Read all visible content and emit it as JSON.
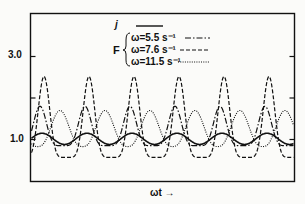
{
  "chart_data": {
    "type": "line",
    "title": "",
    "xlabel": "ωt →",
    "ylabel": "",
    "ylim": [
      0.0,
      4.0
    ],
    "y_ticks": [
      {
        "value": 1.0,
        "label": "1.0"
      },
      {
        "value": 2.0,
        "label": ""
      },
      {
        "value": 3.0,
        "label": "3.0"
      }
    ],
    "x_ticks": [],
    "grid": false,
    "legend_position": "top-center",
    "legend": {
      "group_label": "F",
      "entries": [
        {
          "name": "j",
          "style": "solid"
        },
        {
          "name": "ω=5.5 s⁻¹",
          "style": "dash-dot",
          "group": "F"
        },
        {
          "name": "ω=7.6 s⁻¹",
          "style": "dashed",
          "group": "F"
        },
        {
          "name": "ω=11.5 s⁻¹",
          "style": "dotted",
          "group": "F"
        }
      ]
    },
    "period_px": 45,
    "cycles_shown": 6,
    "series": [
      {
        "name": "j",
        "style": "solid",
        "min": 0.88,
        "max": 1.15,
        "peak_phase_x": [
          42,
          87,
          132,
          177,
          222,
          267
        ]
      },
      {
        "name": "ω=5.5 s⁻¹",
        "style": "dash-dot",
        "min": 0.85,
        "max": 1.8,
        "peak_phase_x": [
          40,
          85,
          130,
          175,
          220,
          265
        ]
      },
      {
        "name": "ω=7.6 s⁻¹",
        "style": "dashed",
        "min": 0.57,
        "max": 2.52,
        "peak_phase_x": [
          44,
          89,
          134,
          179,
          224,
          269
        ]
      },
      {
        "name": "ω=11.5 s⁻¹",
        "style": "dotted",
        "min": 0.83,
        "max": 1.7,
        "peak_phase_x": [
          60,
          105,
          150,
          195,
          240,
          285
        ]
      }
    ]
  },
  "labels": {
    "y3": "3.0",
    "y1": "1.0",
    "xlabel": "ωt →",
    "legend_j": "j",
    "legend_F": "F",
    "legend_55": "ω=5.5 s⁻¹",
    "legend_76": "ω=7.6 s⁻¹",
    "legend_115": "ω=11.5 s⁻¹"
  }
}
